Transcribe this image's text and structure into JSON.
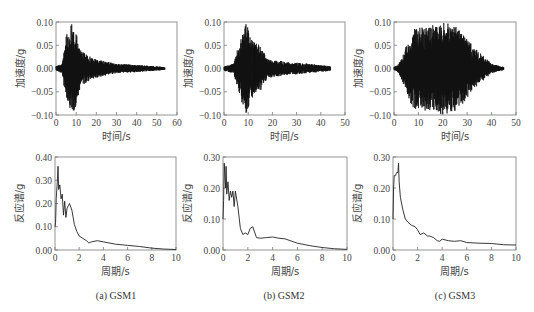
{
  "chart_data": [
    {
      "id": "gsm1_time",
      "type": "line",
      "title": "",
      "xlabel": "时间/s",
      "ylabel": "加速度/g",
      "xlim": [
        0,
        60
      ],
      "ylim": [
        -0.1,
        0.1
      ],
      "xticks": [
        "0",
        "10",
        "20",
        "30",
        "40",
        "50",
        "60"
      ],
      "yticks": [
        "0.10",
        "0.05",
        "0.00",
        "-0.05",
        "-0.10"
      ],
      "duration_s": 54,
      "peak_positive_g": 0.1,
      "peak_negative_g": -0.1,
      "strong_motion_window_s": [
        4,
        12
      ],
      "envelope": {
        "t": [
          0,
          3,
          5,
          8,
          10,
          12,
          15,
          20,
          30,
          40,
          54
        ],
        "amp": [
          0.005,
          0.01,
          0.07,
          0.1,
          0.08,
          0.04,
          0.03,
          0.02,
          0.01,
          0.008,
          0.003
        ]
      }
    },
    {
      "id": "gsm2_time",
      "type": "line",
      "title": "",
      "xlabel": "时间/s",
      "ylabel": "加速度/g",
      "xlim": [
        0,
        50
      ],
      "ylim": [
        -0.1,
        0.1
      ],
      "xticks": [
        "0",
        "10",
        "20",
        "30",
        "40",
        "50"
      ],
      "yticks": [
        "0.10",
        "0.05",
        "0.00",
        "-0.05",
        "-0.10"
      ],
      "duration_s": 44,
      "peak_positive_g": 0.1,
      "peak_negative_g": -0.085,
      "strong_motion_window_s": [
        5,
        16
      ],
      "envelope": {
        "t": [
          0,
          4,
          6,
          9,
          12,
          15,
          18,
          25,
          35,
          44
        ],
        "amp": [
          0.005,
          0.01,
          0.05,
          0.1,
          0.06,
          0.05,
          0.02,
          0.015,
          0.01,
          0.005
        ]
      }
    },
    {
      "id": "gsm3_time",
      "type": "line",
      "title": "",
      "xlabel": "时间/s",
      "ylabel": "加速度/g",
      "xlim": [
        0,
        50
      ],
      "ylim": [
        -0.1,
        0.1
      ],
      "xticks": [
        "0",
        "10",
        "20",
        "30",
        "40",
        "50"
      ],
      "yticks": [
        "0.10",
        "0.05",
        "0.00",
        "-0.05",
        "-0.10"
      ],
      "duration_s": 45,
      "peak_positive_g": 0.1,
      "peak_negative_g": -0.09,
      "strong_motion_window_s": [
        4,
        34
      ],
      "envelope": {
        "t": [
          0,
          2,
          5,
          8,
          12,
          20,
          27,
          32,
          36,
          40,
          45
        ],
        "amp": [
          0.003,
          0.01,
          0.05,
          0.09,
          0.09,
          0.1,
          0.09,
          0.05,
          0.03,
          0.01,
          0.003
        ]
      }
    },
    {
      "id": "gsm1_spectrum",
      "type": "line",
      "title": "",
      "xlabel": "周期/s",
      "ylabel": "反应谱/g",
      "xlim": [
        0,
        10
      ],
      "ylim": [
        0,
        0.4
      ],
      "xticks": [
        "0",
        "2",
        "4",
        "6",
        "8",
        "10"
      ],
      "yticks": [
        "0.40",
        "0.30",
        "0.20",
        "0.10",
        "0.00"
      ],
      "x": [
        0,
        0.05,
        0.1,
        0.2,
        0.25,
        0.3,
        0.4,
        0.5,
        0.6,
        0.7,
        0.8,
        0.9,
        1.0,
        1.1,
        1.2,
        1.4,
        1.6,
        1.8,
        2.0,
        2.3,
        2.6,
        2.8,
        3.0,
        3.5,
        4.0,
        5.0,
        6.0,
        7.0,
        8.0,
        9.0,
        10.0
      ],
      "y": [
        0.1,
        0.12,
        0.22,
        0.3,
        0.36,
        0.26,
        0.28,
        0.22,
        0.24,
        0.15,
        0.21,
        0.14,
        0.18,
        0.19,
        0.2,
        0.17,
        0.11,
        0.08,
        0.06,
        0.05,
        0.04,
        0.03,
        0.035,
        0.04,
        0.035,
        0.025,
        0.02,
        0.015,
        0.008,
        0.004,
        0.002
      ]
    },
    {
      "id": "gsm2_spectrum",
      "type": "line",
      "title": "",
      "xlabel": "周期/s",
      "ylabel": "反应谱/g",
      "xlim": [
        0,
        10
      ],
      "ylim": [
        0,
        0.3
      ],
      "xticks": [
        "0",
        "2",
        "4",
        "6",
        "8",
        "10"
      ],
      "yticks": [
        "0.30",
        "0.20",
        "0.10",
        "0.00"
      ],
      "x": [
        0,
        0.05,
        0.1,
        0.2,
        0.25,
        0.3,
        0.4,
        0.5,
        0.6,
        0.7,
        0.8,
        0.9,
        1.0,
        1.2,
        1.4,
        1.6,
        1.8,
        2.0,
        2.2,
        2.4,
        2.7,
        3.0,
        3.5,
        4.0,
        4.5,
        5.0,
        6.0,
        7.0,
        8.0,
        9.0,
        10.0
      ],
      "y": [
        0.1,
        0.16,
        0.28,
        0.2,
        0.27,
        0.18,
        0.22,
        0.16,
        0.19,
        0.17,
        0.19,
        0.14,
        0.19,
        0.14,
        0.07,
        0.05,
        0.055,
        0.05,
        0.07,
        0.075,
        0.04,
        0.038,
        0.04,
        0.042,
        0.038,
        0.036,
        0.022,
        0.014,
        0.008,
        0.004,
        0.002
      ]
    },
    {
      "id": "gsm3_spectrum",
      "type": "line",
      "title": "",
      "xlabel": "周期/s",
      "ylabel": "反应谱/g",
      "xlim": [
        0,
        10
      ],
      "ylim": [
        0,
        0.3
      ],
      "xticks": [
        "0",
        "2",
        "4",
        "6",
        "8",
        "10"
      ],
      "yticks": [
        "0.30",
        "0.20",
        "0.10",
        "0.00"
      ],
      "x": [
        0,
        0.05,
        0.1,
        0.2,
        0.3,
        0.4,
        0.45,
        0.5,
        0.6,
        0.8,
        1.0,
        1.2,
        1.5,
        1.8,
        2.0,
        2.2,
        2.5,
        2.8,
        3.0,
        3.3,
        3.6,
        3.8,
        4.0,
        4.5,
        5.0,
        5.5,
        6.0,
        7.0,
        8.0,
        9.0,
        10.0
      ],
      "y": [
        0.1,
        0.2,
        0.24,
        0.24,
        0.25,
        0.25,
        0.28,
        0.22,
        0.17,
        0.13,
        0.1,
        0.09,
        0.08,
        0.075,
        0.065,
        0.05,
        0.055,
        0.045,
        0.045,
        0.04,
        0.03,
        0.028,
        0.035,
        0.03,
        0.028,
        0.03,
        0.024,
        0.022,
        0.021,
        0.017,
        0.016
      ]
    }
  ],
  "subplots": {
    "top": [
      {
        "xlabel": "时间/s",
        "ylabel": "加速度/g",
        "xticks": [
          "0",
          "10",
          "20",
          "30",
          "40",
          "50",
          "60"
        ],
        "yticks": [
          "0.10",
          "0.05",
          "0.00",
          "−0.05",
          "−0.10"
        ]
      },
      {
        "xlabel": "时间/s",
        "ylabel": "加速度/g",
        "xticks": [
          "0",
          "10",
          "20",
          "30",
          "40",
          "50"
        ],
        "yticks": [
          "0.10",
          "0.05",
          "0.00",
          "−0.05",
          "−0.10"
        ]
      },
      {
        "xlabel": "时间/s",
        "ylabel": "加速度/g",
        "xticks": [
          "0",
          "10",
          "20",
          "30",
          "40",
          "50"
        ],
        "yticks": [
          "0.10",
          "0.05",
          "0.00",
          "−0.05",
          "−0.10"
        ]
      }
    ],
    "bottom": [
      {
        "xlabel": "周期/s",
        "ylabel": "反应谱/g",
        "xticks": [
          "0",
          "2",
          "4",
          "6",
          "8",
          "10"
        ],
        "yticks": [
          "0.40",
          "0.30",
          "0.20",
          "0.10",
          "0.00"
        ]
      },
      {
        "xlabel": "周期/s",
        "ylabel": "反应谱/g",
        "xticks": [
          "0",
          "2",
          "4",
          "6",
          "8",
          "10"
        ],
        "yticks": [
          "0.30",
          "0.20",
          "0.10",
          "0.00"
        ]
      },
      {
        "xlabel": "周期/s",
        "ylabel": "反应谱/g",
        "xticks": [
          "0",
          "2",
          "4",
          "6",
          "8",
          "10"
        ],
        "yticks": [
          "0.30",
          "0.20",
          "0.10",
          "0.00"
        ]
      }
    ]
  },
  "captions": [
    "(a)  GSM1",
    "(b)  GSM2",
    "(c)  GSM3"
  ]
}
